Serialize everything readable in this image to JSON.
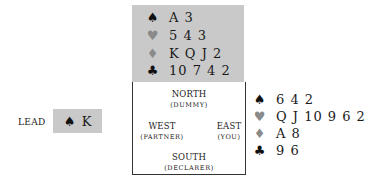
{
  "north": {
    "position": "NORTH",
    "role": "(DUMMY)",
    "hand": [
      {
        "suit": "spades",
        "symbol": "♠",
        "cards": "A 3",
        "color": "black"
      },
      {
        "suit": "hearts",
        "symbol": "♥",
        "cards": "5 4 3",
        "color": "red"
      },
      {
        "suit": "diamonds",
        "symbol": "♦",
        "cards": "K Q J 2",
        "color": "red"
      },
      {
        "suit": "clubs",
        "symbol": "♣",
        "cards": "10 7 4 2",
        "color": "black"
      }
    ]
  },
  "east": {
    "position": "EAST",
    "role": "(YOU)",
    "hand": [
      {
        "suit": "spades",
        "symbol": "♠",
        "cards": "6 4 2",
        "color": "black"
      },
      {
        "suit": "hearts",
        "symbol": "♥",
        "cards": "Q J 10 9 6 2",
        "color": "red"
      },
      {
        "suit": "diamonds",
        "symbol": "♦",
        "cards": "A 8",
        "color": "red"
      },
      {
        "suit": "clubs",
        "symbol": "♣",
        "cards": "9 6",
        "color": "black"
      }
    ]
  },
  "west": {
    "position": "WEST",
    "role": "(PARTNER)"
  },
  "south": {
    "position": "SOUTH",
    "role": "(DECLARER)"
  },
  "lead": {
    "label": "LEAD",
    "symbol": "♠",
    "card": "K"
  },
  "colors": {
    "panel_gray": "#c9c9c9",
    "black_suit": "#111111",
    "red_suit": "#8a8a8a",
    "border": "#333333"
  }
}
